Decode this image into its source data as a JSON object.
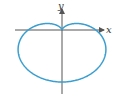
{
  "diagram": {
    "type": "polar-curve",
    "curve": "cardioid",
    "axes": {
      "x_label": "x",
      "y_label": "y"
    },
    "colors": {
      "curve": "#3a9fd0",
      "axis": "#555555"
    }
  }
}
